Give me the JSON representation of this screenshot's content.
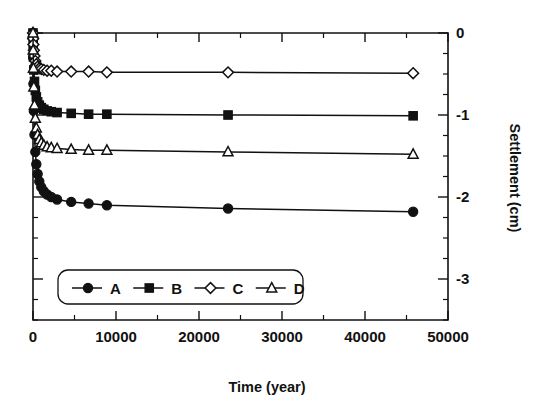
{
  "chart_data": {
    "type": "line",
    "title": "",
    "xlabel": "Time (year)",
    "ylabel": "Settlement (cm)",
    "xlim": [
      0,
      50000
    ],
    "ylim": [
      -3.5,
      0
    ],
    "x_ticks": [
      0,
      10000,
      20000,
      30000,
      40000,
      50000
    ],
    "x_tick_labels": [
      "0",
      "10000",
      "20000",
      "30000",
      "40000",
      "50000"
    ],
    "x_minor_step": 5000,
    "y_ticks": [
      0,
      -1,
      -2,
      -3
    ],
    "y_tick_labels": [
      "0",
      "-1",
      "-2",
      "-3"
    ],
    "y_minor_step": 0.25,
    "y_axis_position": "right",
    "grid": false,
    "legend_position": "lower-left-inside",
    "series": [
      {
        "name": "A",
        "marker": "filled-circle",
        "x": [
          0,
          20,
          50,
          100,
          180,
          280,
          400,
          560,
          760,
          1000,
          1300,
          1700,
          2200,
          2900,
          4600,
          6700,
          8900,
          23500,
          45800
        ],
        "y": [
          0.0,
          -0.3,
          -0.62,
          -0.95,
          -1.24,
          -1.45,
          -1.6,
          -1.72,
          -1.81,
          -1.88,
          -1.93,
          -1.97,
          -2.0,
          -2.03,
          -2.06,
          -2.08,
          -2.1,
          -2.14,
          -2.18
        ]
      },
      {
        "name": "B",
        "marker": "filled-square",
        "x": [
          0,
          20,
          50,
          100,
          180,
          280,
          400,
          560,
          760,
          1000,
          1300,
          1700,
          2200,
          2900,
          4600,
          6700,
          8900,
          23500,
          45800
        ],
        "y": [
          0.0,
          -0.14,
          -0.29,
          -0.45,
          -0.59,
          -0.7,
          -0.78,
          -0.84,
          -0.88,
          -0.91,
          -0.93,
          -0.95,
          -0.96,
          -0.97,
          -0.98,
          -0.99,
          -0.99,
          -1.0,
          -1.01
        ]
      },
      {
        "name": "C",
        "marker": "open-diamond",
        "x": [
          0,
          20,
          50,
          100,
          180,
          280,
          400,
          560,
          760,
          1000,
          1300,
          1700,
          2200,
          2900,
          4600,
          6700,
          8900,
          23500,
          45800
        ],
        "y": [
          0.0,
          -0.07,
          -0.14,
          -0.21,
          -0.28,
          -0.34,
          -0.38,
          -0.41,
          -0.43,
          -0.44,
          -0.45,
          -0.46,
          -0.46,
          -0.47,
          -0.47,
          -0.47,
          -0.48,
          -0.48,
          -0.49
        ]
      },
      {
        "name": "D",
        "marker": "open-triangle",
        "x": [
          0,
          20,
          50,
          100,
          180,
          280,
          400,
          560,
          760,
          1000,
          1300,
          1700,
          2200,
          2900,
          4600,
          6700,
          8900,
          23500,
          45800
        ],
        "y": [
          0.0,
          -0.21,
          -0.43,
          -0.66,
          -0.88,
          -1.04,
          -1.16,
          -1.24,
          -1.3,
          -1.34,
          -1.37,
          -1.39,
          -1.4,
          -1.41,
          -1.42,
          -1.43,
          -1.43,
          -1.45,
          -1.48
        ]
      }
    ],
    "legend_entries": [
      {
        "label": "A",
        "marker": "filled-circle"
      },
      {
        "label": "B",
        "marker": "filled-square"
      },
      {
        "label": "C",
        "marker": "open-diamond"
      },
      {
        "label": "D",
        "marker": "open-triangle"
      }
    ],
    "colors": {
      "ink": "#111111",
      "background": "#ffffff"
    }
  }
}
